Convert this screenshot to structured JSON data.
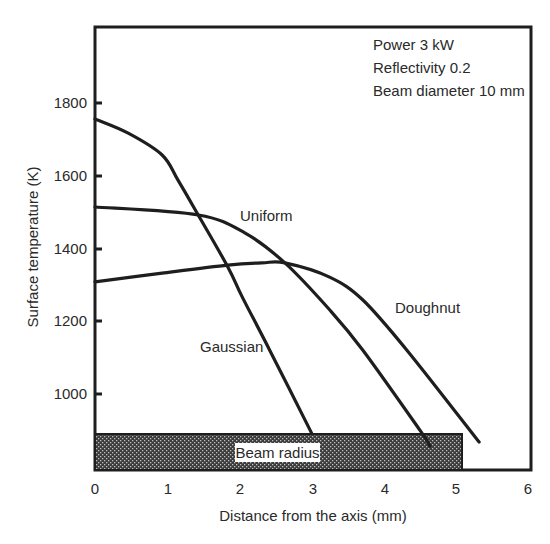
{
  "chart_data": {
    "type": "line",
    "title": "",
    "xlabel": "Distance from the axis (mm)",
    "ylabel": "Surface temperature (K)",
    "xlim": [
      0,
      6
    ],
    "ylim": [
      800,
      2000
    ],
    "x_ticks": [
      0,
      1,
      2,
      3,
      4,
      5,
      6
    ],
    "y_ticks": [
      1000,
      1200,
      1400,
      1600,
      1800
    ],
    "grid": false,
    "legend": "inline labels",
    "annotation_lines": [
      "Power 3 kW",
      "Reflectivity 0.2",
      "Beam diameter 10 mm"
    ],
    "series": [
      {
        "name": "Gaussian",
        "x": [
          0,
          0.46,
          0.93,
          1.15,
          1.43,
          1.84,
          2.04,
          2.42,
          3.0
        ],
        "values": [
          1756,
          1717,
          1657,
          1588,
          1492,
          1349,
          1266,
          1120,
          892
        ]
      },
      {
        "name": "Uniform",
        "x": [
          0,
          1.43,
          2.08,
          2.63,
          3.25,
          3.71,
          4.5,
          4.64
        ],
        "values": [
          1514,
          1492,
          1442,
          1360,
          1231,
          1120,
          900,
          856
        ]
      },
      {
        "name": "Doughnut",
        "x": [
          0,
          0.93,
          1.84,
          2.31,
          2.63,
          3.25,
          3.71,
          4.32,
          5.32
        ],
        "values": [
          1308,
          1332,
          1354,
          1360,
          1360,
          1321,
          1258,
          1120,
          867
        ]
      }
    ],
    "bands": [
      {
        "label": "Beam radius",
        "x_start": 0,
        "x_end": 5.05,
        "pattern": "crosshatch-dark"
      }
    ]
  },
  "labels": {
    "gaussian": "Gaussian",
    "uniform": "Uniform",
    "doughnut": "Doughnut",
    "beam_radius": "Beam radius"
  },
  "axis": {
    "x_title": "Distance from the axis (mm)",
    "y_title": "Surface temperature (K)",
    "x_ticks": [
      "0",
      "1",
      "2",
      "3",
      "4",
      "5",
      "6"
    ],
    "y_ticks": [
      "1000",
      "1200",
      "1400",
      "1600",
      "1800"
    ]
  },
  "annotation": {
    "line1": "Power 3 kW",
    "line2": "Reflectivity 0.2",
    "line3": "Beam diameter 10 mm"
  },
  "colors": {
    "ink": "#1e1e1e",
    "band_fill": "#3a3a3a",
    "background": "#ffffff"
  }
}
